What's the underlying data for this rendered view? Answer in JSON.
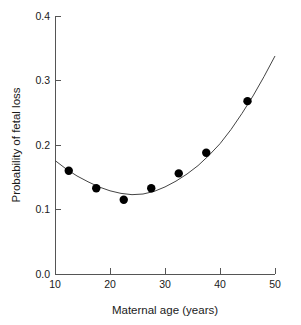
{
  "chart_data": {
    "type": "scatter",
    "title": "",
    "xlabel": "Maternal age (years)",
    "ylabel": "Probability of fetal loss",
    "xlim": [
      10,
      50
    ],
    "ylim": [
      0.0,
      0.4
    ],
    "xticks": [
      10,
      20,
      30,
      40,
      50
    ],
    "xtick_labels": [
      "10",
      "20",
      "30",
      "40",
      "50"
    ],
    "yticks": [
      0.0,
      0.1,
      0.2,
      0.3,
      0.4
    ],
    "ytick_labels": [
      "0.0",
      "0.1",
      "0.2",
      "0.3",
      "0.4"
    ],
    "grid": false,
    "legend": false,
    "legend_position": "none",
    "marker": "filled-circle",
    "marker_color": "#000000",
    "curve_color": "#444444",
    "x": [
      12.5,
      17.5,
      22.5,
      27.5,
      32.5,
      37.5,
      45.0
    ],
    "y": [
      0.16,
      0.133,
      0.115,
      0.133,
      0.156,
      0.188,
      0.268
    ],
    "series": [
      {
        "name": "Observed probability of fetal loss",
        "x": [
          12.5,
          17.5,
          22.5,
          27.5,
          32.5,
          37.5,
          45.0
        ],
        "values": [
          0.16,
          0.133,
          0.115,
          0.133,
          0.156,
          0.188,
          0.268
        ]
      },
      {
        "name": "Fitted quadratic curve",
        "x": [
          10,
          12,
          14,
          16,
          18,
          20,
          22,
          24,
          26,
          28,
          30,
          32,
          34,
          36,
          38,
          40,
          42,
          44,
          46,
          48,
          50
        ],
        "values": [
          0.176,
          0.163,
          0.152,
          0.143,
          0.135,
          0.129,
          0.125,
          0.123,
          0.124,
          0.128,
          0.135,
          0.144,
          0.155,
          0.168,
          0.184,
          0.202,
          0.224,
          0.249,
          0.276,
          0.306,
          0.338
        ]
      }
    ]
  },
  "axes": {
    "x_title": "Maternal age (years)",
    "y_title": "Probability of fetal loss"
  },
  "tick_text": {
    "y": [
      "0.4",
      "0.3",
      "0.2",
      "0.1",
      "0.0"
    ],
    "x": [
      "10",
      "20",
      "30",
      "40",
      "50"
    ]
  }
}
